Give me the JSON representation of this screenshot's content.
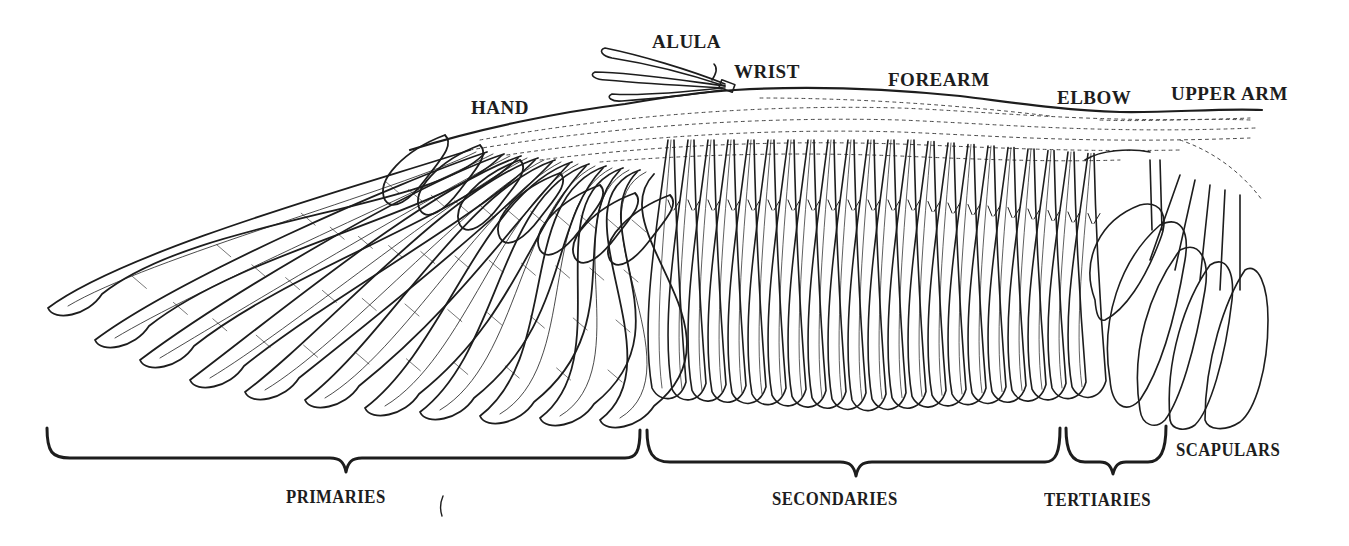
{
  "diagram": {
    "ink_color": "#1d1d1d",
    "background": "#ffffff",
    "labels": {
      "alula": "ALULA",
      "wrist": "WRIST",
      "forearm": "FOREARM",
      "hand": "HAND",
      "elbow": "ELBOW",
      "upper_arm": "UPPER ARM",
      "scapulars": "SCAPULARS",
      "primaries": "PRIMARIES",
      "secondaries": "SECONDARIES",
      "tertiaries": "TERTIARIES"
    },
    "brackets": [
      {
        "name": "primaries",
        "x_start": 47,
        "x_end": 640
      },
      {
        "name": "secondaries",
        "x_start": 647,
        "x_end": 1060
      },
      {
        "name": "tertiaries",
        "x_start": 1066,
        "x_end": 1166
      }
    ],
    "stray_mark": "("
  }
}
